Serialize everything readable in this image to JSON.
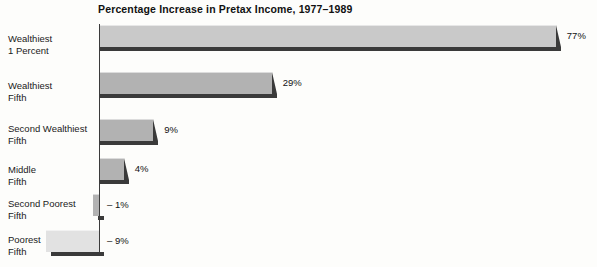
{
  "chart_data": {
    "type": "bar",
    "orientation": "horizontal",
    "title": "Percentage Increase in Pretax Income, 1977–1989",
    "xlabel": "",
    "ylabel": "",
    "grid": false,
    "legend": null,
    "xlim": [
      -12,
      82
    ],
    "categories": [
      "Wealthiest 1 Percent",
      "Wealthiest Fifth",
      "Second Wealthiest Fifth",
      "Middle Fifth",
      "Second Poorest Fifth",
      "Poorest Fifth"
    ],
    "values": [
      77,
      29,
      9,
      4,
      -1,
      -9
    ],
    "data_labels": [
      "77%",
      "29%",
      "9%",
      "4%",
      "– 1%",
      "– 9%"
    ]
  },
  "chart": {
    "title": "Percentage Increase in Pretax Income, 1977–1989",
    "axis_color": "#3b3b3b",
    "bar_colors": [
      "#c9c9c9",
      "#b2b2b2",
      "#b2b2b2",
      "#b2b2b2",
      "#b2b2b2",
      "#e2e2e2"
    ],
    "shadow_color": "#3a3a3a",
    "background": "#fdfdfb",
    "bars": [
      {
        "category_line1": "Wealthiest",
        "category_line2": "1 Percent",
        "value": 77,
        "label": "77%"
      },
      {
        "category_line1": "Wealthiest",
        "category_line2": "Fifth",
        "value": 29,
        "label": "29%"
      },
      {
        "category_line1": "Second Wealthiest",
        "category_line2": "Fifth",
        "value": 9,
        "label": "9%"
      },
      {
        "category_line1": "Middle",
        "category_line2": "Fifth",
        "value": 4,
        "label": "4%"
      },
      {
        "category_line1": "Second Poorest",
        "category_line2": "Fifth",
        "value": -1,
        "label": "– 1%"
      },
      {
        "category_line1": "Poorest",
        "category_line2": "Fifth",
        "value": -9,
        "label": "– 9%"
      }
    ]
  }
}
